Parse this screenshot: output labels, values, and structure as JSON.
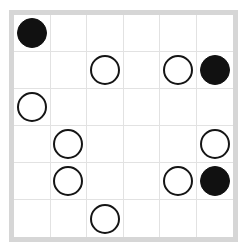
{
  "board": {
    "title": "Circle grid puzzle",
    "rows": 6,
    "columns": 6,
    "frame_color": "#d6d6d6",
    "gridline_color": "#e2e2e2",
    "background_color": "#ffffff",
    "stone_black_color": "#111111",
    "stone_white_fill": "#ffffff",
    "stone_white_stroke": "#151515",
    "legend": {
      "black": "filled circle",
      "white": "outlined circle",
      "empty": "empty cell"
    },
    "counts": {
      "black": 3,
      "white": 8,
      "empty": 25
    },
    "cells": [
      [
        {
          "state": "black",
          "name": "cell-r0-c0"
        },
        {
          "state": "empty",
          "name": "cell-r0-c1"
        },
        {
          "state": "empty",
          "name": "cell-r0-c2"
        },
        {
          "state": "empty",
          "name": "cell-r0-c3"
        },
        {
          "state": "empty",
          "name": "cell-r0-c4"
        },
        {
          "state": "empty",
          "name": "cell-r0-c5"
        }
      ],
      [
        {
          "state": "empty",
          "name": "cell-r1-c0"
        },
        {
          "state": "empty",
          "name": "cell-r1-c1"
        },
        {
          "state": "white",
          "name": "cell-r1-c2"
        },
        {
          "state": "empty",
          "name": "cell-r1-c3"
        },
        {
          "state": "white",
          "name": "cell-r1-c4"
        },
        {
          "state": "black",
          "name": "cell-r1-c5"
        }
      ],
      [
        {
          "state": "white",
          "name": "cell-r2-c0"
        },
        {
          "state": "empty",
          "name": "cell-r2-c1"
        },
        {
          "state": "empty",
          "name": "cell-r2-c2"
        },
        {
          "state": "empty",
          "name": "cell-r2-c3"
        },
        {
          "state": "empty",
          "name": "cell-r2-c4"
        },
        {
          "state": "empty",
          "name": "cell-r2-c5"
        }
      ],
      [
        {
          "state": "empty",
          "name": "cell-r3-c0"
        },
        {
          "state": "white",
          "name": "cell-r3-c1"
        },
        {
          "state": "empty",
          "name": "cell-r3-c2"
        },
        {
          "state": "empty",
          "name": "cell-r3-c3"
        },
        {
          "state": "empty",
          "name": "cell-r3-c4"
        },
        {
          "state": "white",
          "name": "cell-r3-c5"
        }
      ],
      [
        {
          "state": "empty",
          "name": "cell-r4-c0"
        },
        {
          "state": "white",
          "name": "cell-r4-c1"
        },
        {
          "state": "empty",
          "name": "cell-r4-c2"
        },
        {
          "state": "empty",
          "name": "cell-r4-c3"
        },
        {
          "state": "white",
          "name": "cell-r4-c4"
        },
        {
          "state": "black",
          "name": "cell-r4-c5"
        }
      ],
      [
        {
          "state": "empty",
          "name": "cell-r5-c0"
        },
        {
          "state": "empty",
          "name": "cell-r5-c1"
        },
        {
          "state": "white",
          "name": "cell-r5-c2"
        },
        {
          "state": "empty",
          "name": "cell-r5-c3"
        },
        {
          "state": "empty",
          "name": "cell-r5-c4"
        },
        {
          "state": "empty",
          "name": "cell-r5-c5"
        }
      ]
    ]
  }
}
